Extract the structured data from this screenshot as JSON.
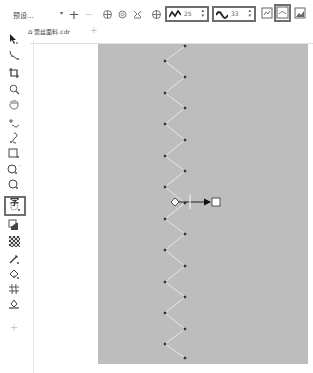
{
  "property_bar": {
    "preset_label": "预设...",
    "preset_dropdown": "▾",
    "add_preset": "+",
    "remove_preset": "−",
    "frequency_value": "25",
    "amplitude_value": "33",
    "spin_arrows": "⌃⌄"
  },
  "document": {
    "tab_title": "蕾丝面料.cdr",
    "new_tab": "+"
  },
  "toolbox": {
    "text_tool_glyph": "字"
  },
  "canvas": {
    "background_color": "#bdbdbd",
    "zigzag": {
      "left_x": 67,
      "right_x": 87,
      "points": [
        [
          87,
          2
        ],
        [
          67,
          17
        ],
        [
          87,
          33
        ],
        [
          67,
          49
        ],
        [
          87,
          64
        ],
        [
          67,
          80
        ],
        [
          87,
          96
        ],
        [
          67,
          112
        ],
        [
          87,
          127
        ],
        [
          67,
          143
        ],
        [
          87,
          159
        ],
        [
          67,
          175
        ],
        [
          87,
          190
        ],
        [
          67,
          206
        ],
        [
          87,
          222
        ],
        [
          67,
          238
        ],
        [
          87,
          253
        ],
        [
          67,
          269
        ],
        [
          87,
          285
        ],
        [
          67,
          300
        ],
        [
          87,
          314
        ]
      ]
    },
    "interactive_handle": {
      "diamond_x": 77,
      "line_x": 92,
      "square_x": 118,
      "y": 158
    }
  }
}
